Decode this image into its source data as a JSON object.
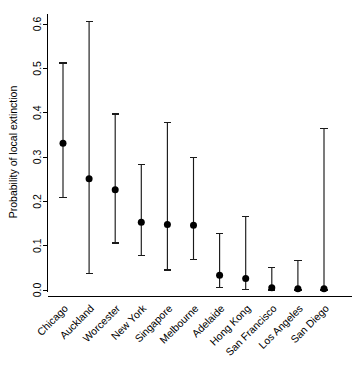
{
  "chart_data": {
    "type": "scatter",
    "title": "",
    "subtitle": "",
    "xlabel": "",
    "ylabel": "Probability of local extinction",
    "ylim": [
      -0.02,
      0.63
    ],
    "yticks": [
      0.0,
      0.1,
      0.2,
      0.3,
      0.4,
      0.5,
      0.6
    ],
    "ytick_labels": [
      "0.0",
      "0.1",
      "0.2",
      "0.3",
      "0.4",
      "0.5",
      "0.6"
    ],
    "grid": false,
    "legend": null,
    "categories": [
      "Chicago",
      "Auckland",
      "Worcester",
      "New York",
      "Singapore",
      "Melbourne",
      "Adelaide",
      "Hong Kong",
      "San Francisco",
      "Los Angeles",
      "San Diego"
    ],
    "values": [
      0.331,
      0.251,
      0.226,
      0.153,
      0.148,
      0.146,
      0.033,
      0.026,
      0.005,
      0.003,
      0.003
    ],
    "error_low": [
      0.209,
      0.037,
      0.106,
      0.078,
      0.045,
      0.069,
      0.006,
      0.002,
      0.0,
      0.0,
      0.0
    ],
    "error_high": [
      0.512,
      0.605,
      0.397,
      0.283,
      0.377,
      0.299,
      0.128,
      0.166,
      0.05,
      0.066,
      0.365
    ],
    "marker": "filled-circle",
    "marker_color": "#000000",
    "errorbar_color": "#1a1a1a",
    "errorbar_style": "capped-vertical"
  },
  "axes": {
    "y_axis_label": "Probability of local extinction"
  }
}
